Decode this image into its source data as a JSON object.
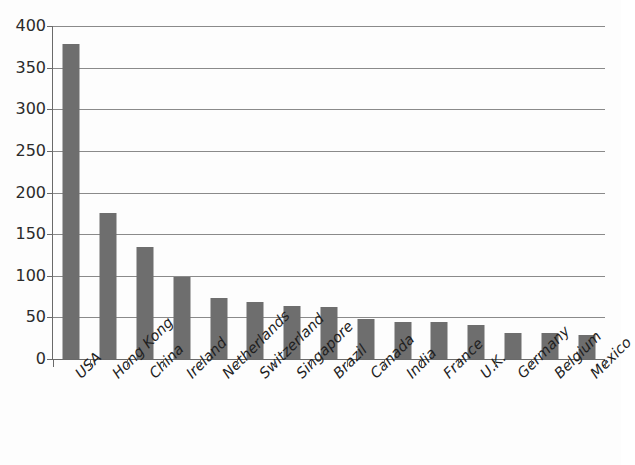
{
  "chart_data": {
    "type": "bar",
    "title": "",
    "subtitle": "",
    "xlabel": "",
    "ylabel": "",
    "categories": [
      "USA",
      "Hong Kong",
      "China",
      "Ireland",
      "Netherlands",
      "Switzerland",
      "Singapore",
      "Brazil",
      "Canada",
      "India",
      "France",
      "U.K.",
      "Germany",
      "Belgium",
      "Mexico"
    ],
    "values": [
      378,
      175,
      135,
      99,
      73,
      69,
      64,
      63,
      48,
      44,
      44,
      41,
      31,
      31,
      29
    ],
    "series": [
      {
        "name": "",
        "values": [
          378,
          175,
          135,
          99,
          73,
          69,
          64,
          63,
          48,
          44,
          44,
          41,
          31,
          31,
          29
        ]
      }
    ],
    "ylim": [
      0,
      400
    ],
    "yticks": [
      0,
      50,
      100,
      150,
      200,
      250,
      300,
      350,
      400
    ],
    "ytick_labels": [
      "0",
      "50",
      "100",
      "150",
      "200",
      "250",
      "300",
      "350",
      "400"
    ],
    "grid": "horizontal",
    "legend": "none",
    "bar_color": "#6e6e6e",
    "gridline_color": "#8a8a8a",
    "axis_color": "#6a6a6a",
    "background_color": "#fdfdfd",
    "label_rotation": -45,
    "annotations": []
  }
}
